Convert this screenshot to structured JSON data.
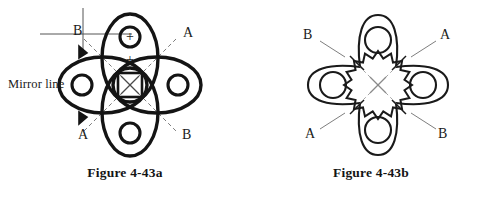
{
  "page": {
    "background_color": "#ffffff",
    "ink_color": "#1a1a1a",
    "width": 492,
    "height": 198
  },
  "figures": [
    {
      "id": "figure-4-43a",
      "caption": "Figure 4-43a",
      "description": "Four overlapping bold ellipses in a four-fold rosette with small circles, plus signs, center square with an X, dashed symmetry lines and a mirror line crosshair",
      "center": {
        "x": 130,
        "y": 85
      },
      "labels": [
        {
          "name": "mirror-line-label",
          "text": "Mirror line",
          "x": 8,
          "y": 84
        },
        {
          "name": "label-b-top-left",
          "text": "B",
          "x": 73,
          "y": 31
        },
        {
          "name": "label-a-top-right",
          "text": "A",
          "x": 183,
          "y": 33
        },
        {
          "name": "label-a-bottom-left",
          "text": "A",
          "x": 78,
          "y": 135
        },
        {
          "name": "label-b-bottom-right",
          "text": "B",
          "x": 182,
          "y": 135
        }
      ],
      "plus_marks": [
        {
          "name": "plus-in-top-circle",
          "text": "+",
          "x": 131,
          "y": 37
        },
        {
          "name": "plus-below-top-circle",
          "text": "+",
          "x": 131,
          "y": 60
        }
      ],
      "center_mark": {
        "name": "center-x-mark",
        "text": "x",
        "x": 130,
        "y": 85
      },
      "petals": [
        {
          "name": "petal-north",
          "cx": 130,
          "cy": 58,
          "rx": 28,
          "ry": 44,
          "rotate": 0,
          "circle": {
            "cx": 130,
            "cy": 37,
            "r": 10
          }
        },
        {
          "name": "petal-east",
          "cx": 157,
          "cy": 85,
          "rx": 44,
          "ry": 28,
          "rotate": 0,
          "circle": {
            "cx": 178,
            "cy": 85,
            "r": 10
          }
        },
        {
          "name": "petal-south",
          "cx": 130,
          "cy": 112,
          "rx": 28,
          "ry": 44,
          "rotate": 0,
          "circle": {
            "cx": 130,
            "cy": 133,
            "r": 10
          }
        },
        {
          "name": "petal-west",
          "cx": 103,
          "cy": 85,
          "rx": 44,
          "ry": 28,
          "rotate": 0,
          "circle": {
            "cx": 82,
            "cy": 85,
            "r": 10
          }
        }
      ],
      "mirror_line": {
        "name": "mirror-line",
        "vertical": {
          "x1": 83,
          "y1": 8,
          "x2": 83,
          "y2": 52
        },
        "horizontal": {
          "x1": 40,
          "y1": 34,
          "x2": 132,
          "y2": 34
        }
      }
    },
    {
      "id": "figure-4-43b",
      "caption": "Figure 4-43b",
      "description": "Four-lobed clover outline with a circle in each lobe, a jagged star rosette at the center marked with an X, and four diagonal tick marks labelled A and B",
      "center": {
        "x": 128,
        "y": 85
      },
      "labels": [
        {
          "name": "label-b-top-left",
          "text": "B",
          "x": 53,
          "y": 35
        },
        {
          "name": "label-a-top-right",
          "text": "A",
          "x": 190,
          "y": 35
        },
        {
          "name": "label-a-bottom-left",
          "text": "A",
          "x": 55,
          "y": 134
        },
        {
          "name": "label-b-bottom-right",
          "text": "B",
          "x": 188,
          "y": 134
        }
      ],
      "center_mark": {
        "name": "center-x-mark",
        "text": "x",
        "x": 128,
        "y": 85
      },
      "lobes": [
        {
          "name": "lobe-north",
          "circle": {
            "cx": 128,
            "cy": 40,
            "r": 13
          }
        },
        {
          "name": "lobe-east",
          "circle": {
            "cx": 173,
            "cy": 85,
            "r": 13
          }
        },
        {
          "name": "lobe-south",
          "circle": {
            "cx": 128,
            "cy": 130,
            "r": 13
          }
        },
        {
          "name": "lobe-west",
          "circle": {
            "cx": 83,
            "cy": 85,
            "r": 13
          }
        }
      ],
      "star": {
        "name": "center-star",
        "cx": 128,
        "cy": 85,
        "outer_r": 34,
        "inner_r": 27,
        "points": 16
      }
    }
  ]
}
